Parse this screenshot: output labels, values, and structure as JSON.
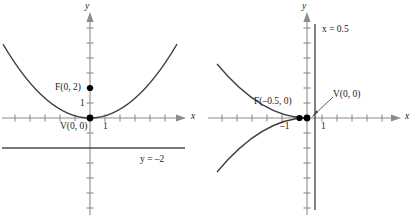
{
  "figures": [
    {
      "id": "upward-parabola",
      "axes": {
        "x_label": "x",
        "y_label": "y",
        "x_tick_label": "1",
        "y_tick_label": "1"
      },
      "points": [
        {
          "name": "focus",
          "label": "F(0, 2)",
          "x": 0,
          "y": 2
        },
        {
          "name": "vertex",
          "label": "V(0, 0)",
          "x": 0,
          "y": 0
        }
      ],
      "directrix": {
        "label": "y = –2",
        "value": -2,
        "orientation": "horizontal"
      },
      "curve": {
        "equation": "y = x²/8",
        "opens": "up"
      }
    },
    {
      "id": "leftward-parabola",
      "axes": {
        "x_label": "x",
        "y_label": "y",
        "x_tick_label_positive": "1",
        "x_tick_label_negative": "–1"
      },
      "points": [
        {
          "name": "focus",
          "label": "F(–0.5, 0)",
          "x": -0.5,
          "y": 0
        },
        {
          "name": "vertex",
          "label": "V(0, 0)",
          "x": 0,
          "y": 0
        }
      ],
      "directrix": {
        "label": "x = 0.5",
        "value": 0.5,
        "orientation": "vertical"
      },
      "curve": {
        "equation": "x = –y²/2",
        "opens": "left"
      }
    }
  ],
  "colors": {
    "axis": "#8c8c8c",
    "curve": "#3d3d3d",
    "directrix": "#4a4a4a",
    "point": "#000000",
    "text": "#1a1a1a",
    "background": "#ffffff"
  }
}
